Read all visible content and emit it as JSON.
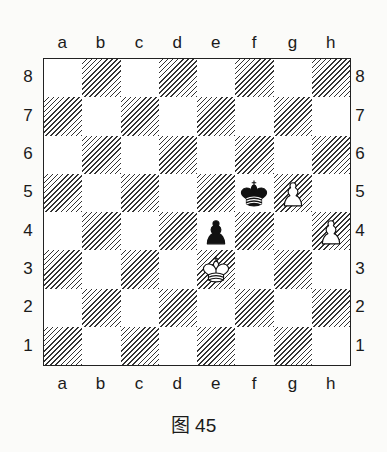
{
  "diagram": {
    "caption": "图 45",
    "files": [
      "a",
      "b",
      "c",
      "d",
      "e",
      "f",
      "g",
      "h"
    ],
    "ranks": [
      "8",
      "7",
      "6",
      "5",
      "4",
      "3",
      "2",
      "1"
    ],
    "pieces": [
      {
        "square": "e3",
        "color": "white",
        "type": "king",
        "icon": "white-king-icon"
      },
      {
        "square": "f5",
        "color": "black",
        "type": "king",
        "icon": "black-king-icon"
      },
      {
        "square": "e4",
        "color": "black",
        "type": "pawn",
        "icon": "black-pawn-icon"
      },
      {
        "square": "g5",
        "color": "white",
        "type": "pawn",
        "icon": "white-pawn-icon"
      },
      {
        "square": "h4",
        "color": "white",
        "type": "pawn",
        "icon": "white-pawn-icon"
      }
    ],
    "square_style": {
      "light": "#ffffff",
      "dark": "hatched"
    }
  }
}
